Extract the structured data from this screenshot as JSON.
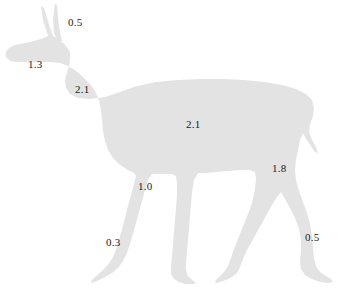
{
  "figure": {
    "type": "annotated-silhouette",
    "orientation": "facing-left",
    "background_color": "#ffffff",
    "silhouette_color": "#e3e3e3",
    "label_color": "#1a1a1a"
  },
  "annotations": [
    {
      "id": "ears",
      "part": "ears",
      "value": "0.5",
      "x": 68,
      "y": 17
    },
    {
      "id": "head",
      "part": "head",
      "value": "1.3",
      "x": 28,
      "y": 59
    },
    {
      "id": "neck",
      "part": "neck",
      "value": "2.1",
      "x": 75,
      "y": 84
    },
    {
      "id": "body",
      "part": "body-torso",
      "value": "2.1",
      "x": 186,
      "y": 119
    },
    {
      "id": "hind-leg",
      "part": "hind-leg-upper",
      "value": "1.8",
      "x": 272,
      "y": 163
    },
    {
      "id": "front-leg",
      "part": "front-leg",
      "value": "1.0",
      "x": 138,
      "y": 181
    },
    {
      "id": "front-hoof",
      "part": "front-hoof",
      "value": "0.3",
      "x": 106,
      "y": 237
    },
    {
      "id": "hind-hoof",
      "part": "hind-hoof",
      "value": "0.5",
      "x": 305,
      "y": 232
    }
  ]
}
